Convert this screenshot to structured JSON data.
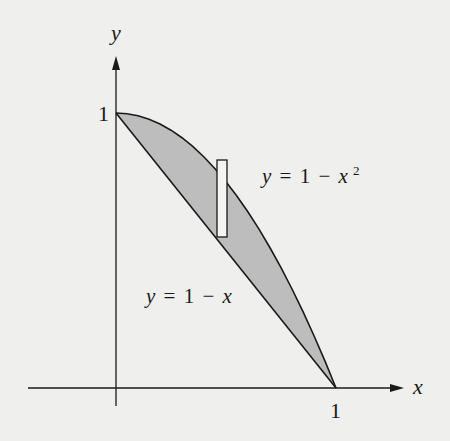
{
  "diagram": {
    "type": "region-between-curves",
    "axes": {
      "x_label": "x",
      "y_label": "y",
      "x_tick_label": "1",
      "y_tick_label": "1"
    },
    "curves": [
      {
        "name": "upper",
        "equation_lhs": "y",
        "equation_eq": "=",
        "equation_rhs_const": "1",
        "equation_op": "−",
        "equation_var": "x",
        "equation_exp": "2",
        "full": "y = 1 − x²"
      },
      {
        "name": "lower",
        "equation_lhs": "y",
        "equation_eq": "=",
        "equation_rhs_const": "1",
        "equation_op": "−",
        "equation_var": "x",
        "full": "y = 1 − x"
      }
    ],
    "region": {
      "description": "Shaded region between y = 1 − x² (above) and y = 1 − x (below) for 0 ≤ x ≤ 1",
      "fill_color": "#bdbdbd"
    },
    "strip": {
      "description": "Representative vertical rectangle inside the shaded region",
      "fill_color": "#f4f4f2"
    },
    "colors": {
      "background": "#efefed",
      "stroke": "#1a1a1a",
      "shade": "#bdbdbd"
    }
  }
}
